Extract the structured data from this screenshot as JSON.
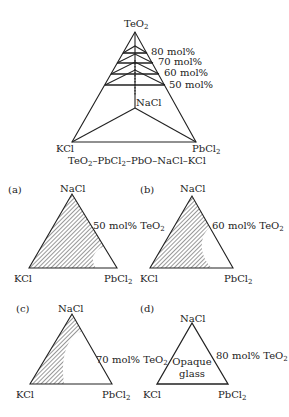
{
  "main_diagram": {
    "apex_label": "TeO",
    "apex_sub": "2",
    "interior_label": "NaCl",
    "bottom_left_label": "KCl",
    "bottom_right_label": "PbCl",
    "bottom_right_sub": "2",
    "levels": [
      {
        "label": "80 mol%"
      },
      {
        "label": "70 mol%"
      },
      {
        "label": "60 mol%"
      },
      {
        "label": "50 mol%"
      }
    ],
    "caption": {
      "p1": "TeO",
      "s1": "2",
      "p2": "–PbCl",
      "s2": "2",
      "p3": "–PbO–NaCl–KCl"
    }
  },
  "subfigures": [
    {
      "tag": "(a)",
      "top": "NaCl",
      "left": "KCl",
      "right": "PbCl",
      "right_sub": "2",
      "composition": "50 mol% TeO",
      "composition_sub": "2"
    },
    {
      "tag": "(b)",
      "top": "NaCl",
      "left": "KCl",
      "right": "PbCl",
      "right_sub": "2",
      "composition": "60 mol% TeO",
      "composition_sub": "2"
    },
    {
      "tag": "(c)",
      "top": "NaCl",
      "left": "KCl",
      "right": "PbCl",
      "right_sub": "2",
      "composition": "70 mol% TeO",
      "composition_sub": "2"
    },
    {
      "tag": "(d)",
      "top": "NaCl",
      "left": "KCl",
      "right": "PbCl",
      "right_sub": "2",
      "composition": "80 mol% TeO",
      "composition_sub": "2",
      "region_label_1": "Opaque",
      "region_label_2": "glass"
    }
  ],
  "colors": {
    "line": "#222222",
    "hatch": "#333333",
    "background": "#ffffff"
  }
}
